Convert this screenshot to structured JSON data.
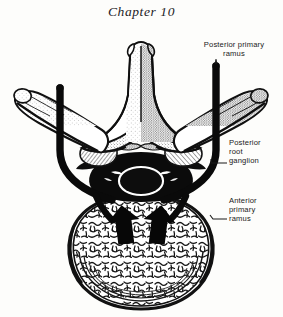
{
  "page": {
    "running_head": "Chapter 10",
    "background_color": "#fdfdfb",
    "ink_color": "#161616",
    "width": 283,
    "height": 317
  },
  "figure": {
    "kind": "anatomical-line-illustration",
    "style": "black-and-white engraving with stipple and trabecular hatching",
    "structures": [
      {
        "name": "spinous-process",
        "description": "tall midline process projecting superiorly, stippled shading"
      },
      {
        "name": "lamina-left",
        "description": "left lamina flaring from spinous process base"
      },
      {
        "name": "lamina-right",
        "description": "right lamina flaring from spinous process base"
      },
      {
        "name": "transverse-process-left",
        "description": "elongated left lateral process"
      },
      {
        "name": "transverse-process-right",
        "description": "elongated right lateral process"
      },
      {
        "name": "superior-articular-process-left",
        "description": "left articular facet knob"
      },
      {
        "name": "superior-articular-process-right",
        "description": "right articular facet knob"
      },
      {
        "name": "vertebral-canal",
        "description": "dark central canal containing dural sac with pale ring"
      },
      {
        "name": "vertebral-body",
        "description": "large rounded anterior body filled with cancellous trabecular texture"
      },
      {
        "name": "nerve-band-left",
        "description": "thick black spinal nerve band, vertical then hooking medially"
      },
      {
        "name": "nerve-band-right",
        "description": "thick black spinal nerve band, vertical then hooking medially"
      },
      {
        "name": "arrow-left",
        "description": "solid black block arrow pointing superiorly"
      },
      {
        "name": "arrow-right",
        "description": "solid black block arrow pointing superiorly"
      }
    ]
  },
  "labels": {
    "posterior_primary_ramus": "Posterior primary\nramus",
    "posterior_root_ganglion": "Posterior\nroot\nganglion",
    "anterior_primary_ramus": "Anterior\nprimary\nramus"
  }
}
